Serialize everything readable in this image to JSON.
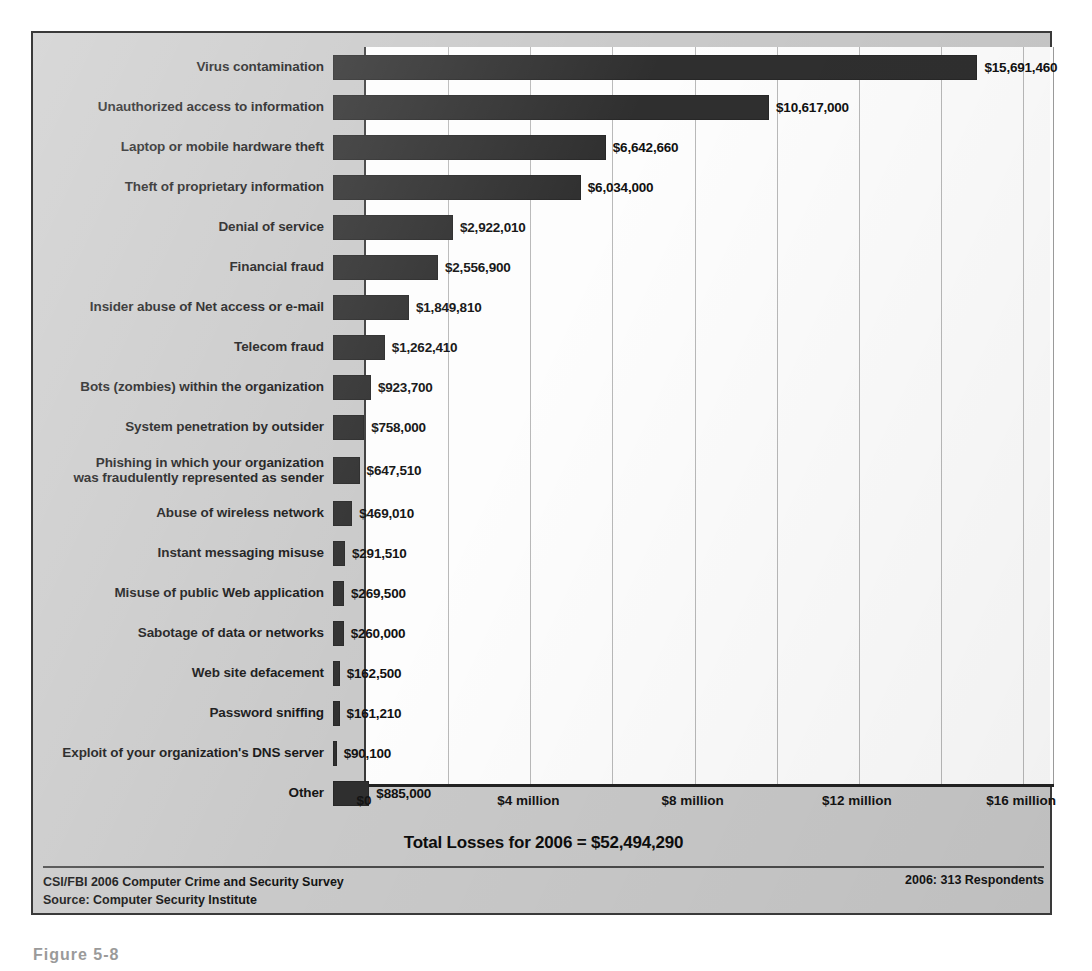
{
  "chart_data": {
    "type": "bar",
    "orientation": "horizontal",
    "title": "",
    "xlabel": "",
    "ylabel": "",
    "xlim": [
      0,
      16800000
    ],
    "grid": true,
    "gridline_interval": 2000000,
    "tick_labels": [
      "$0",
      "$4 million",
      "$8 million",
      "$12 million",
      "$16 million"
    ],
    "tick_values": [
      0,
      4000000,
      8000000,
      12000000,
      16000000
    ],
    "categories": [
      "Virus contamination",
      "Unauthorized access to information",
      "Laptop or mobile hardware theft",
      "Theft of proprietary information",
      "Denial of service",
      "Financial fraud",
      "Insider abuse of Net access or e-mail",
      "Telecom fraud",
      "Bots (zombies) within the organization",
      "System penetration by outsider",
      "Phishing in which your organization was fraudulently represented as sender",
      "Abuse of wireless network",
      "Instant messaging misuse",
      "Misuse of public Web application",
      "Sabotage of data or networks",
      "Web site defacement",
      "Password sniffing",
      "Exploit of your organization's DNS server",
      "Other"
    ],
    "values": [
      15691460,
      10617000,
      6642660,
      6034000,
      2922010,
      2556900,
      1849810,
      1262410,
      923700,
      758000,
      647510,
      469010,
      291510,
      269500,
      260000,
      162500,
      161210,
      90100,
      885000
    ],
    "value_labels": [
      "$15,691,460",
      "$10,617,000",
      "$6,642,660",
      "$6,034,000",
      "$2,922,010",
      "$2,556,900",
      "$1,849,810",
      "$1,262,410",
      "$923,700",
      "$758,000",
      "$647,510",
      "$469,010",
      "$291,510",
      "$269,500",
      "$260,000",
      "$162,500",
      "$161,210",
      "$90,100",
      "$885,000"
    ],
    "bar_color": "#2f2f2f",
    "plot_background": "#fdfdfd",
    "panel_background": "#c9c9c9"
  },
  "rows": [
    {
      "label_line1": "Virus contamination",
      "label_line2": "",
      "value_label": "$15,691,460",
      "value": 15691460
    },
    {
      "label_line1": "Unauthorized access to information",
      "label_line2": "",
      "value_label": "$10,617,000",
      "value": 10617000
    },
    {
      "label_line1": "Laptop or mobile hardware theft",
      "label_line2": "",
      "value_label": "$6,642,660",
      "value": 6642660
    },
    {
      "label_line1": "Theft of proprietary information",
      "label_line2": "",
      "value_label": "$6,034,000",
      "value": 6034000
    },
    {
      "label_line1": "Denial of service",
      "label_line2": "",
      "value_label": "$2,922,010",
      "value": 2922010
    },
    {
      "label_line1": "Financial fraud",
      "label_line2": "",
      "value_label": "$2,556,900",
      "value": 2556900
    },
    {
      "label_line1": "Insider abuse of Net access or e-mail",
      "label_line2": "",
      "value_label": "$1,849,810",
      "value": 1849810
    },
    {
      "label_line1": "Telecom fraud",
      "label_line2": "",
      "value_label": "$1,262,410",
      "value": 1262410
    },
    {
      "label_line1": "Bots (zombies) within the organization",
      "label_line2": "",
      "value_label": "$923,700",
      "value": 923700
    },
    {
      "label_line1": "System penetration by outsider",
      "label_line2": "",
      "value_label": "$758,000",
      "value": 758000
    },
    {
      "label_line1": "Phishing in which your organization",
      "label_line2": "was fraudulently represented as sender",
      "value_label": "$647,510",
      "value": 647510
    },
    {
      "label_line1": "Abuse of wireless network",
      "label_line2": "",
      "value_label": "$469,010",
      "value": 469010
    },
    {
      "label_line1": "Instant messaging misuse",
      "label_line2": "",
      "value_label": "$291,510",
      "value": 291510
    },
    {
      "label_line1": "Misuse of public Web application",
      "label_line2": "",
      "value_label": "$269,500",
      "value": 269500
    },
    {
      "label_line1": "Sabotage of data or networks",
      "label_line2": "",
      "value_label": "$260,000",
      "value": 260000
    },
    {
      "label_line1": "Web site defacement",
      "label_line2": "",
      "value_label": "$162,500",
      "value": 162500
    },
    {
      "label_line1": "Password sniffing",
      "label_line2": "",
      "value_label": "$161,210",
      "value": 161210
    },
    {
      "label_line1": "Exploit of your organization's DNS server",
      "label_line2": "",
      "value_label": "$90,100",
      "value": 90100
    },
    {
      "label_line1": "Other",
      "label_line2": "",
      "value_label": "$885,000",
      "value": 885000
    }
  ],
  "axis": {
    "ticks": [
      {
        "label": "$0",
        "value": 0
      },
      {
        "label": "$4 million",
        "value": 4000000
      },
      {
        "label": "$8 million",
        "value": 8000000
      },
      {
        "label": "$12 million",
        "value": 12000000
      },
      {
        "label": "$16 million",
        "value": 16000000
      }
    ]
  },
  "total_line": "Total Losses for 2006 = $52,494,290",
  "footer": {
    "line1": "CSI/FBI 2006 Computer Crime and Security Survey",
    "line2": "Source: Computer Security Institute",
    "respondents": "2006: 313 Respondents"
  },
  "caption": "Figure 5-8"
}
